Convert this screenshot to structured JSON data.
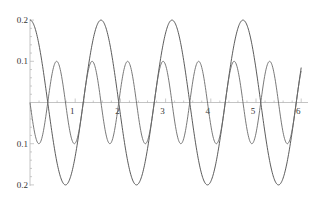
{
  "chart_data": {
    "type": "line",
    "title": "",
    "xlabel": "",
    "ylabel": "",
    "xlim": [
      0,
      6
    ],
    "ylim": [
      -0.2,
      0.2
    ],
    "grid": false,
    "legend": "none",
    "x_ticks": [
      {
        "value": 1,
        "label": "1"
      },
      {
        "value": 2,
        "label": "2"
      },
      {
        "value": 3,
        "label": "3"
      },
      {
        "value": 4,
        "label": "4"
      },
      {
        "value": 5,
        "label": "5"
      },
      {
        "value": 6,
        "label": "6"
      }
    ],
    "y_ticks": [
      {
        "value": 0.2,
        "label": "0.2"
      },
      {
        "value": 0.1,
        "label": "0.1"
      },
      {
        "value": -0.1,
        "label": "0.1"
      },
      {
        "value": -0.2,
        "label": "0.2"
      }
    ],
    "series": [
      {
        "name": "0.2 cos(4x)",
        "amplitude": 0.2,
        "frequency": 4,
        "phase": "cos",
        "color": "#4a4a4a",
        "x_range": [
          0,
          6
        ]
      },
      {
        "name": "-0.1 sin(8x)",
        "amplitude": -0.1,
        "frequency": 8,
        "phase": "sin",
        "color": "#6a6a6a",
        "x_range": [
          0,
          6
        ]
      }
    ]
  }
}
